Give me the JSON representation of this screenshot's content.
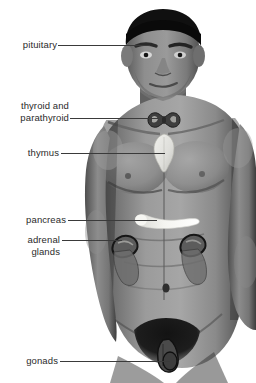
{
  "figure": {
    "background_color": "#ffffff",
    "text_color": "#2b2b2b",
    "leader_color": "#3a3a3a",
    "skin_color": "#8d8d8d",
    "hair_color": "#101010",
    "highlight_light": "#e8e8e4",
    "highlight_dark": "#3a3a3a"
  },
  "labels": [
    {
      "id": "pituitary",
      "lines": [
        "pituitary"
      ],
      "organ": "pituitary-gland"
    },
    {
      "id": "thyroid",
      "lines": [
        "thyroid and",
        "parathyroid"
      ],
      "organ": "thyroid-parathyroid-gland"
    },
    {
      "id": "thymus",
      "lines": [
        "thymus"
      ],
      "organ": "thymus-gland"
    },
    {
      "id": "pancreas",
      "lines": [
        "pancreas"
      ],
      "organ": "pancreas-gland"
    },
    {
      "id": "adrenal",
      "lines": [
        "adrenal",
        "glands"
      ],
      "organ": "adrenal-glands"
    },
    {
      "id": "gonads",
      "lines": [
        "gonads"
      ],
      "organ": "gonads-testes"
    }
  ],
  "label_text": {
    "pituitary": "pituitary",
    "thyroid_l1": "thyroid and",
    "thyroid_l2": "parathyroid",
    "thymus": "thymus",
    "pancreas": "pancreas",
    "adrenal_l1": "adrenal",
    "adrenal_l2": "glands",
    "gonads": "gonads"
  }
}
